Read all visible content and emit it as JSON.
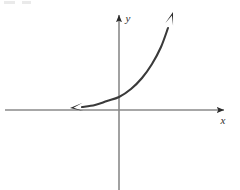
{
  "figure": {
    "width": 240,
    "height": 190,
    "background_color": "#ffffff",
    "axis_color": "#8a8a8a",
    "curve_color": "#3a3a3a",
    "arrow_color": "#2b2b2b",
    "label_color": "#2f2f2f"
  },
  "axes": {
    "x_label": "x",
    "y_label": "y",
    "x_axis": {
      "y_position": 110,
      "x_start": 5,
      "x_end": 229,
      "arrow_at": "right"
    },
    "y_axis": {
      "x_position": 119,
      "y_start": 10,
      "y_end": 190,
      "arrow_at": "top"
    }
  },
  "chart_data": {
    "type": "line",
    "title": "",
    "subtitle": "",
    "xlabel": "x",
    "ylabel": "y",
    "grid": false,
    "legend": null,
    "origin_px": [
      119,
      110
    ],
    "xlim": [
      -115,
      111
    ],
    "ylim": [
      -80,
      100
    ],
    "series": [
      {
        "name": "exponential curve",
        "arrow_start": true,
        "arrow_end": true,
        "points_px": [
          [
            70,
            108
          ],
          [
            82,
            107
          ],
          [
            95,
            105
          ],
          [
            107,
            101
          ],
          [
            119,
            97
          ],
          [
            131,
            89
          ],
          [
            142,
            78
          ],
          [
            152,
            64
          ],
          [
            161,
            47
          ],
          [
            168,
            28
          ],
          [
            173,
            12
          ]
        ]
      }
    ]
  }
}
